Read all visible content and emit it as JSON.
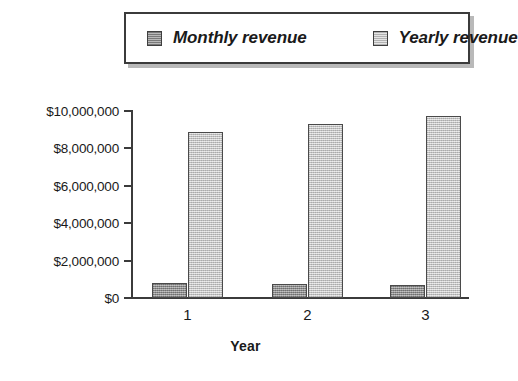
{
  "chart_data": {
    "type": "bar",
    "title": "",
    "xlabel": "Year",
    "ylabel": "",
    "categories": [
      "1",
      "2",
      "3"
    ],
    "series": [
      {
        "name": "Monthly revenue",
        "values": [
          800000,
          750000,
          700000
        ],
        "color": "#9b9b9b"
      },
      {
        "name": "Yearly revenue",
        "values": [
          8870000,
          9300000,
          9730000
        ],
        "color": "#d2d2d2"
      }
    ],
    "ylim": [
      0,
      10000000
    ],
    "ytick_values": [
      10000000,
      8000000,
      6000000,
      4000000,
      2000000,
      0
    ],
    "ytick_labels": [
      "$10,000,000",
      "$8,000,000",
      "$6,000,000",
      "$4,000,000",
      "$2,000,000",
      "$0"
    ],
    "grid": false,
    "legend_position": "top"
  },
  "legend": {
    "entries": [
      {
        "label": "Monthly revenue",
        "swatch": "monthly-swatch"
      },
      {
        "label": "Yearly revenue",
        "swatch": "yearly-swatch"
      }
    ]
  },
  "axes": {
    "y_labels": [
      "$10,000,000",
      "$8,000,000",
      "$6,000,000",
      "$4,000,000",
      "$2,000,000",
      "$0"
    ],
    "x_labels": [
      "1",
      "2",
      "3"
    ],
    "x_title": "Year"
  },
  "colors": {
    "monthly": "#9b9b9b",
    "yearly": "#d2d2d2",
    "axis": "#3b3b3b",
    "background": "#ffffff"
  }
}
